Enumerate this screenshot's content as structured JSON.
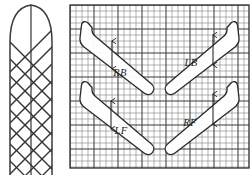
{
  "figure": {
    "background_color": "#ffffff",
    "line_color": "#2b2b2b",
    "width": 251,
    "height": 175
  },
  "left_panel": {
    "name": "lattice-profile",
    "description": "Elongated vertical shape with rounded arch top filled with a diagonal diamond lattice and a vertical centre line",
    "outline_color": "#3a3a3a",
    "lattice_color": "#333333",
    "fill_color": "#ffffff",
    "bounds": {
      "x": 2,
      "y": 3,
      "width": 58,
      "height": 172
    },
    "lattice": {
      "type": "diamond-crosshatch",
      "diagonal_spacing": 17,
      "has_center_line": true
    }
  },
  "grid_panel": {
    "name": "measurement-grid",
    "bounds": {
      "x": 70,
      "y": 5,
      "width": 179,
      "height": 163
    },
    "minor_cell_size": 6,
    "major_every": 4,
    "minor_line_color": "#7c7c7c",
    "major_line_color": "#3a3a3a",
    "border_color": "#2b2b2b",
    "background_color": "#ffffff"
  },
  "blades": [
    {
      "id": "rb",
      "label": "RB",
      "name": "blade-rb",
      "position": "top-left",
      "orientation_deg": 42,
      "tip": "upper-left",
      "label_x": 120,
      "label_y": 72,
      "arrow": {
        "type": "double-headed-vertical",
        "x": 112,
        "y_top": 40,
        "y_bottom": 70
      }
    },
    {
      "id": "lb",
      "label": "LB",
      "name": "blade-lb",
      "position": "top-right",
      "orientation_deg": -42,
      "tip": "upper-right",
      "label_x": 189,
      "label_y": 63,
      "arrow": {
        "type": "double-headed-vertical",
        "x": 213,
        "y_top": 34,
        "y_bottom": 66
      }
    },
    {
      "id": "lf",
      "label": "LF",
      "name": "blade-lf",
      "position": "bottom-left",
      "orientation_deg": 42,
      "tip": "upper-left",
      "label_x": 121,
      "label_y": 130,
      "arrow": {
        "type": "double-headed-vertical",
        "x": 111,
        "y_top": 100,
        "y_bottom": 130
      }
    },
    {
      "id": "rf",
      "label": "RF",
      "name": "blade-rf",
      "position": "bottom-right",
      "orientation_deg": -42,
      "tip": "upper-right",
      "label_x": 188,
      "label_y": 122,
      "arrow": {
        "type": "double-headed-vertical",
        "x": 213,
        "y_top": 93,
        "y_bottom": 125
      }
    }
  ]
}
